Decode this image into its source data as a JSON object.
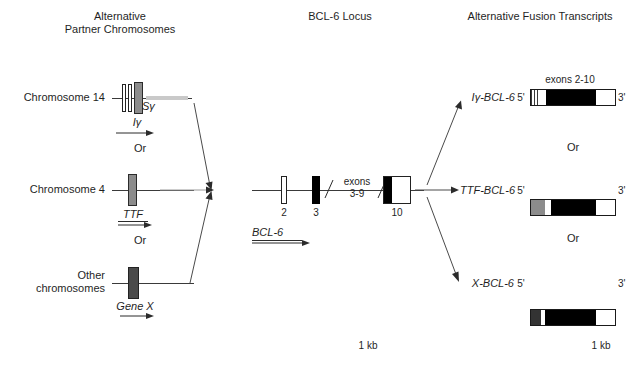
{
  "headers": {
    "left": "Alternative\nPartner Chromosomes",
    "center": "BCL-6 Locus",
    "right": "Alternative Fusion Transcripts"
  },
  "partners": {
    "rows": [
      {
        "label": "Chromosome 14",
        "gene_label": "Iγ",
        "secondary_label": "Sγ"
      },
      {
        "label": "Chromosome 4",
        "gene_label": "TTF"
      },
      {
        "label": "Other\nchromosomes",
        "gene_label": "Gene X"
      }
    ],
    "or_1": "Or",
    "or_2": "Or"
  },
  "locus": {
    "gene_label": "BCL-6",
    "exon_2": "2",
    "exon_3": "3",
    "exons_mid": "exons\n3-9",
    "exon_10": "10"
  },
  "transcripts": {
    "items": [
      {
        "name": "Iγ-BCL-6",
        "five_prime": "5'",
        "three_prime": "3'",
        "caption": "exons 2-10"
      },
      {
        "name": "TTF-BCL-6",
        "five_prime": "5'",
        "three_prime": "3'"
      },
      {
        "name": "X-BCL-6",
        "five_prime": "5'",
        "three_prime": "3'"
      }
    ],
    "or_1": "Or",
    "or_2": "Or"
  },
  "scales": {
    "center": "1 kb",
    "right": "1 kb"
  },
  "colors": {
    "line": "#3a3a3a",
    "black": "#000000",
    "gray": "#8c8c8c",
    "dark": "#4a4a4a",
    "white": "#ffffff"
  }
}
